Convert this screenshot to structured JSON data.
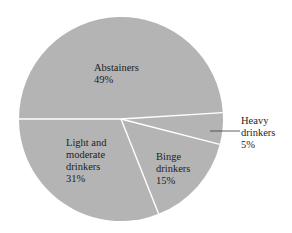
{
  "chart_data": {
    "type": "pie",
    "title": "",
    "categories": [
      "Abstainers",
      "Heavy drinkers",
      "Binge drinkers",
      "Light and moderate drinkers"
    ],
    "values": [
      49,
      5,
      15,
      31
    ],
    "unit": "%",
    "start_angle_deg": 180,
    "direction": "clockwise",
    "slice_color": "#b4b4b4",
    "divider_color": "#ffffff",
    "labels": [
      {
        "lines": [
          "Abstainers",
          "49%"
        ],
        "placement": "inside"
      },
      {
        "lines": [
          "Heavy",
          "drinkers",
          "5%"
        ],
        "placement": "outside",
        "leader_line": true
      },
      {
        "lines": [
          "Binge",
          "drinkers",
          "15%"
        ],
        "placement": "inside"
      },
      {
        "lines": [
          "Light and",
          "moderate",
          "drinkers",
          "31%"
        ],
        "placement": "inside"
      }
    ],
    "legend": "none"
  }
}
